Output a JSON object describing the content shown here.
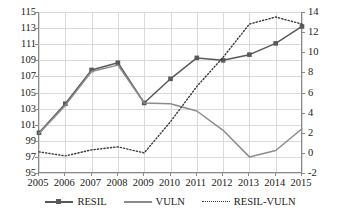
{
  "chart_data": {
    "type": "line",
    "title": "",
    "xlabel": "",
    "ylabel": "",
    "grid": true,
    "legend_position": "bottom",
    "categories": [
      "2005",
      "2006",
      "2007",
      "2008",
      "2009",
      "2010",
      "2011",
      "2012",
      "2013",
      "2014",
      "2015"
    ],
    "axes": {
      "left": {
        "label": "",
        "min": 95,
        "max": 115,
        "step": 2,
        "ticks": [
          "115",
          "113",
          "111",
          "109",
          "107",
          "105",
          "103",
          "101",
          "99",
          "97",
          "95"
        ],
        "series": [
          "RESIL",
          "VULN"
        ]
      },
      "right": {
        "label": "",
        "min": -2,
        "max": 14,
        "step": 2,
        "ticks": [
          "14",
          "12",
          "10",
          "8",
          "6",
          "4",
          "2",
          "0",
          "-2"
        ],
        "series": [
          "RESIL-VULN"
        ]
      }
    },
    "series": [
      {
        "name": "RESIL",
        "axis": "left",
        "style": "line-marker",
        "marker": "square",
        "color": "#595959",
        "values": [
          100.0,
          103.6,
          107.8,
          108.7,
          103.7,
          106.7,
          109.3,
          109.0,
          109.7,
          111.1,
          113.2
        ]
      },
      {
        "name": "VULN",
        "axis": "left",
        "style": "line",
        "marker": "none",
        "color": "#8c8c8c",
        "values": [
          99.9,
          103.4,
          107.6,
          108.4,
          103.7,
          103.6,
          102.7,
          100.3,
          97.0,
          97.8,
          100.5
        ]
      },
      {
        "name": "RESIL-VULN",
        "axis": "right",
        "style": "dotted",
        "marker": "none",
        "color": "#3a3a3a",
        "values": [
          0.1,
          -0.3,
          0.3,
          0.6,
          0.0,
          3.1,
          6.6,
          9.5,
          12.8,
          13.5,
          12.8
        ]
      }
    ]
  },
  "legend": {
    "items": [
      {
        "label": "RESIL",
        "key": "line-with-square-marker"
      },
      {
        "label": "VULN",
        "key": "solid-line"
      },
      {
        "label": "RESIL-VULN",
        "key": "dotted-line"
      }
    ]
  }
}
